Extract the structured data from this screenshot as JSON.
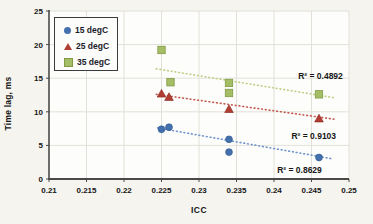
{
  "figure": {
    "background": "#f5f4ef",
    "plot_background": "#fdfdfb",
    "grid_color": "#e2e1d9",
    "axis_color": "#4a4a48",
    "text_color": "#161616"
  },
  "chart_data": {
    "type": "scatter",
    "title": "",
    "xlabel": "ICC",
    "ylabel": "Time lag, ms",
    "xlim": [
      0.21,
      0.25
    ],
    "ylim": [
      0,
      25
    ],
    "grid": true,
    "legend_position": "top-left",
    "x_tick_values": [
      0.21,
      0.215,
      0.22,
      0.225,
      0.23,
      0.235,
      0.24,
      0.245,
      0.25
    ],
    "x_tick_labels": [
      "0.21",
      "0.215",
      "0.22",
      "0.225",
      "0.23",
      "0.235",
      "0.24",
      "0.245",
      "0.25"
    ],
    "y_tick_values": [
      0,
      5,
      10,
      15,
      20,
      25
    ],
    "y_tick_labels": [
      "0",
      "5",
      "10",
      "15",
      "20",
      "25"
    ],
    "series": [
      {
        "name": "15 degC",
        "marker": "circle",
        "color": "#4470ad",
        "edge_color": "#2f5a94",
        "trend_color": "#6f93cc",
        "points": [
          [
            0.225,
            7.4
          ],
          [
            0.226,
            7.7
          ],
          [
            0.234,
            5.9
          ],
          [
            0.234,
            4.0
          ],
          [
            0.246,
            3.2
          ]
        ],
        "trend": [
          [
            0.2245,
            7.6
          ],
          [
            0.2478,
            3.0
          ]
        ],
        "r2_label": "R² = 0.8629",
        "r2_anchor": [
          0.2434,
          1.3
        ]
      },
      {
        "name": "25 degC",
        "marker": "triangle",
        "color": "#b13d33",
        "edge_color": "#8f2f28",
        "trend_color": "#c4574e",
        "points": [
          [
            0.225,
            12.7
          ],
          [
            0.226,
            12.2
          ],
          [
            0.234,
            10.4
          ],
          [
            0.246,
            9.0
          ]
        ],
        "trend": [
          [
            0.2243,
            12.6
          ],
          [
            0.248,
            8.9
          ]
        ],
        "r2_label": "R² = 0.9103",
        "r2_anchor": [
          0.2453,
          6.4
        ]
      },
      {
        "name": "35 degC",
        "marker": "square",
        "color": "#a5bd64",
        "edge_color": "#819a47",
        "trend_color": "#bfcf85",
        "points": [
          [
            0.225,
            19.2
          ],
          [
            0.2262,
            14.4
          ],
          [
            0.234,
            14.3
          ],
          [
            0.234,
            12.8
          ],
          [
            0.246,
            12.6
          ]
        ],
        "trend": [
          [
            0.2243,
            16.4
          ],
          [
            0.248,
            12.1
          ]
        ],
        "r2_label": "R² = 0.4892",
        "r2_anchor": [
          0.2462,
          15.3
        ]
      }
    ]
  }
}
